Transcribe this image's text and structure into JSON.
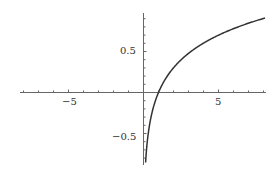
{
  "chart_data": {
    "type": "line",
    "title": "",
    "xlabel": "",
    "ylabel": "",
    "function": "log10(x)",
    "xlim": [
      -8.2,
      8.2
    ],
    "ylim": [
      -0.87,
      0.96
    ],
    "grid": false,
    "x_ticks": [
      -5,
      5
    ],
    "y_ticks": [
      0.5,
      -0.5
    ],
    "x_tick_labels": [
      "−5",
      "5"
    ],
    "y_tick_labels": [
      "0.5",
      "−0.5"
    ],
    "series": [
      {
        "name": "log10(x)",
        "color": "#333333",
        "x": [
          0.14,
          0.2,
          0.3,
          0.5,
          0.75,
          1,
          1.5,
          2,
          3,
          4,
          5,
          6,
          7,
          8
        ],
        "y": [
          -0.854,
          -0.699,
          -0.523,
          -0.301,
          -0.125,
          0,
          0.176,
          0.301,
          0.477,
          0.602,
          0.699,
          0.778,
          0.845,
          0.903
        ]
      }
    ]
  },
  "labels": {
    "xm5": "−5",
    "x5": "5",
    "y05": "0.5",
    "ym05": "−0.5"
  }
}
